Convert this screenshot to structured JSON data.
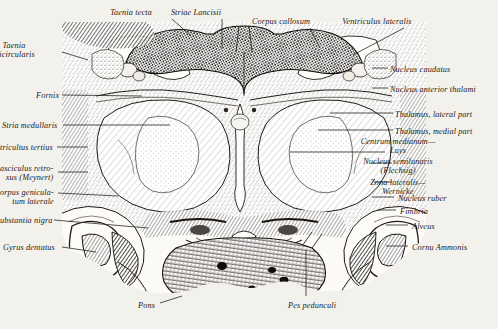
{
  "plate": {
    "kind": "anatomical-engraving",
    "subject": "Coronal section of the human brain through the thalamus",
    "background_color": "#f3f1ec",
    "ink_color": "#1c1a17",
    "width": 498,
    "height": 329
  },
  "labels": {
    "top": [
      {
        "id": "taenia-tecta",
        "text": "Taenia tecta",
        "x": 131,
        "y": 8,
        "align": "center"
      },
      {
        "id": "striae-lancisii",
        "text": "Striae Lancisii",
        "x": 196,
        "y": 8,
        "align": "center"
      },
      {
        "id": "corpus-callosum",
        "text": "Corpus callosum",
        "x": 281,
        "y": 17,
        "align": "center"
      },
      {
        "id": "ventriculus-lateralis",
        "text": "Ventriculus lateralis",
        "x": 377,
        "y": 17,
        "align": "center"
      }
    ],
    "left": [
      {
        "id": "taenia-semicircularis",
        "text": "Taenia\nmicircularis",
        "x": 14,
        "y": 41,
        "align": "center"
      },
      {
        "id": "fornix",
        "text": "Fornix",
        "x": 36,
        "y": 91,
        "align": "left"
      },
      {
        "id": "stria-medullaris",
        "text": "Stria medullaris",
        "x": 2,
        "y": 121,
        "align": "left"
      },
      {
        "id": "ventriculus-tertius",
        "text": "tricultus tertius",
        "x": 0,
        "y": 143,
        "align": "left"
      },
      {
        "id": "fasciculus-retroflexus",
        "text": "asciculus retro-\nxus (Meynert)",
        "x": 0,
        "y": 164,
        "align": "left"
      },
      {
        "id": "corpus-geniculatum-laterale",
        "text": "orpus genicula-\ntum laterale",
        "x": 0,
        "y": 188,
        "align": "left"
      },
      {
        "id": "substantia-nigra",
        "text": "ubstantia nigra",
        "x": 0,
        "y": 216,
        "align": "left"
      },
      {
        "id": "gyrus-dentatus",
        "text": "Gyrus dentatus",
        "x": 3,
        "y": 243,
        "align": "left"
      }
    ],
    "right": [
      {
        "id": "nucleus-caudatus",
        "text": "Nucleus caudatus",
        "x": 390,
        "y": 65,
        "align": "left"
      },
      {
        "id": "nucleus-anterior-thalami",
        "text": "Nucleus anterior thalami",
        "x": 390,
        "y": 85,
        "align": "left"
      },
      {
        "id": "thalamus-lateral-part",
        "text": "Thalamus, lateral part",
        "x": 395,
        "y": 110,
        "align": "left"
      },
      {
        "id": "thalamus-medial-part",
        "text": "Thalamus, medial part",
        "x": 395,
        "y": 127,
        "align": "left"
      },
      {
        "id": "centrum-medianum-luys",
        "text": "Centrum medianum—\nLuys",
        "x": 398,
        "y": 137,
        "align": "center"
      },
      {
        "id": "nucleus-semilunaris-flechsig",
        "text": "Nucleus semilunaris\n(Flechsig)",
        "x": 398,
        "y": 157,
        "align": "center"
      },
      {
        "id": "zona-lateralis-wernicke",
        "text": "Zona lateralis—\nWernicke",
        "x": 398,
        "y": 178,
        "align": "center"
      },
      {
        "id": "nucleus-ruber",
        "text": "Nucleus ruber",
        "x": 398,
        "y": 194,
        "align": "left"
      },
      {
        "id": "fimbria",
        "text": "Fimbria",
        "x": 400,
        "y": 207,
        "align": "left"
      },
      {
        "id": "alveus",
        "text": "Alveus",
        "x": 412,
        "y": 222,
        "align": "left"
      },
      {
        "id": "cornu-ammonis",
        "text": "Cornu Ammonis",
        "x": 412,
        "y": 243,
        "align": "left"
      }
    ],
    "bottom": [
      {
        "id": "pons",
        "text": "Pons",
        "x": 138,
        "y": 301,
        "align": "left"
      },
      {
        "id": "pes-pedunculi",
        "text": "Pes pedunculi",
        "x": 288,
        "y": 301,
        "align": "left"
      }
    ]
  },
  "leaders": [
    {
      "id": "leader-taenia-tecta",
      "x1": 172,
      "y1": 19,
      "x2": 190,
      "y2": 35
    },
    {
      "id": "leader-striae-lancisii",
      "x1": 222,
      "y1": 19,
      "x2": 222,
      "y2": 49
    },
    {
      "id": "leader-corpus-callosum",
      "x1": 310,
      "y1": 28,
      "x2": 320,
      "y2": 48
    },
    {
      "id": "leader-ventriculus-lat",
      "x1": 404,
      "y1": 28,
      "x2": 353,
      "y2": 55
    },
    {
      "id": "leader-taenia-semi",
      "x1": 62,
      "y1": 52,
      "x2": 88,
      "y2": 60
    },
    {
      "id": "leader-fornix",
      "x1": 62,
      "y1": 95,
      "x2": 142,
      "y2": 96
    },
    {
      "id": "leader-stria-medullaris",
      "x1": 63,
      "y1": 125,
      "x2": 170,
      "y2": 125
    },
    {
      "id": "leader-ventriculus-tertius",
      "x1": 57,
      "y1": 147,
      "x2": 88,
      "y2": 147
    },
    {
      "id": "leader-fasciculus",
      "x1": 58,
      "y1": 172,
      "x2": 88,
      "y2": 172
    },
    {
      "id": "leader-corpus-genic",
      "x1": 58,
      "y1": 193,
      "x2": 118,
      "y2": 196
    },
    {
      "id": "leader-substantia-nigra",
      "x1": 54,
      "y1": 220,
      "x2": 148,
      "y2": 228
    },
    {
      "id": "leader-gyrus-dentatus",
      "x1": 62,
      "y1": 247,
      "x2": 96,
      "y2": 252
    },
    {
      "id": "leader-nucleus-caudatus",
      "x1": 372,
      "y1": 68,
      "x2": 388,
      "y2": 68
    },
    {
      "id": "leader-nucleus-ant-thal",
      "x1": 372,
      "y1": 88,
      "x2": 388,
      "y2": 88
    },
    {
      "id": "leader-thal-lateral",
      "x1": 330,
      "y1": 113,
      "x2": 393,
      "y2": 113
    },
    {
      "id": "leader-thal-medial",
      "x1": 318,
      "y1": 130,
      "x2": 393,
      "y2": 130
    },
    {
      "id": "leader-centrum-medianum",
      "x1": 290,
      "y1": 152,
      "x2": 385,
      "y2": 152
    },
    {
      "id": "leader-nucleus-semilunaris",
      "x1": 372,
      "y1": 163,
      "x2": 392,
      "y2": 163
    },
    {
      "id": "leader-zona-lateralis",
      "x1": 374,
      "y1": 182,
      "x2": 392,
      "y2": 182
    },
    {
      "id": "leader-nucleus-ruber",
      "x1": 372,
      "y1": 197,
      "x2": 394,
      "y2": 197
    },
    {
      "id": "leader-fimbria",
      "x1": 378,
      "y1": 210,
      "x2": 396,
      "y2": 210
    },
    {
      "id": "leader-alveus",
      "x1": 386,
      "y1": 225,
      "x2": 408,
      "y2": 225
    },
    {
      "id": "leader-cornu-ammonis",
      "x1": 386,
      "y1": 246,
      "x2": 408,
      "y2": 246
    },
    {
      "id": "leader-pons",
      "x1": 160,
      "y1": 303,
      "x2": 182,
      "y2": 296
    },
    {
      "id": "leader-pes-pedunculi",
      "x1": 306,
      "y1": 296,
      "x2": 306,
      "y2": 250
    }
  ]
}
